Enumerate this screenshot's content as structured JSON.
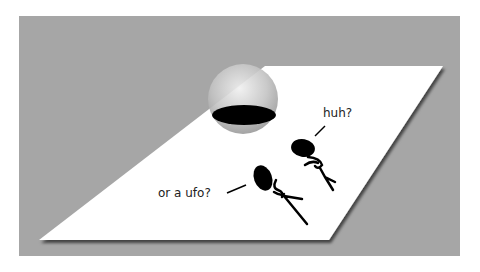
{
  "illustration": {
    "background_color": "#ffffff",
    "panel_color": "#a6a6a6",
    "plane_color": "#ffffff",
    "sphere_color": "#c8c8c8",
    "hole_color": "#000000",
    "figures": [
      {
        "speech": "huh?"
      },
      {
        "speech": "or a ufo?"
      }
    ]
  }
}
